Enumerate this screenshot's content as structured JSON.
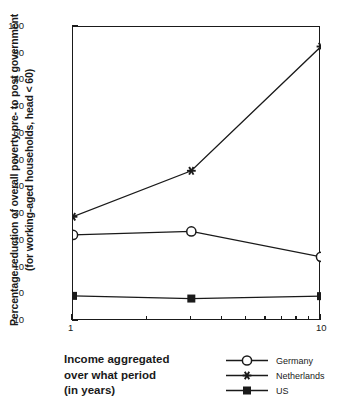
{
  "chart_data": {
    "type": "line",
    "title": "",
    "subtitle": "",
    "xlabel_lines": [
      "Income aggregated",
      "over what period",
      "(in years)"
    ],
    "ylabel_lines": [
      "Percentage reduction of overall poverty pre- to post government",
      "(for working-aged households, head < 60)"
    ],
    "x": [
      1,
      3,
      10
    ],
    "x_scale": "log",
    "xlim": [
      1,
      10
    ],
    "x_tick_labels": [
      "1",
      "10"
    ],
    "x_tick_values": [
      1,
      10
    ],
    "x_minor_ticks": [
      2,
      3,
      4,
      5,
      6,
      7,
      8,
      9
    ],
    "ylim": [
      -10,
      100
    ],
    "y_ticks": [
      -10,
      0,
      10,
      20,
      30,
      40,
      50,
      60,
      70,
      80,
      90,
      100
    ],
    "y_tick_labels": [
      "-10",
      "0",
      "10",
      "20",
      "30",
      "40",
      "50",
      "60",
      "70",
      "80",
      "90",
      "100"
    ],
    "y_minor_step": 5,
    "grid": false,
    "legend_position": "bottom-right",
    "series": [
      {
        "name": "Germany",
        "marker": "open-circle",
        "values": [
          22.2,
          23.5,
          14.0
        ],
        "color": "#1a1a1a"
      },
      {
        "name": "Netherlands",
        "marker": "asterisk",
        "values": [
          29.0,
          46.2,
          92.7
        ],
        "color": "#1a1a1a"
      },
      {
        "name": "US",
        "marker": "filled-square",
        "values": [
          -0.6,
          -1.6,
          -0.7
        ],
        "color": "#1a1a1a"
      }
    ]
  },
  "axis": {
    "y_title_line1": "Percentage reduction of overall poverty pre- to post government",
    "y_title_line2": "(for working-aged households, head < 60)",
    "x_title_line1": "Income aggregated",
    "x_title_line2": "over what period",
    "x_title_line3": "(in years)"
  },
  "legend": {
    "items": [
      {
        "label": "Germany",
        "marker": "open-circle"
      },
      {
        "label": "Netherlands",
        "marker": "asterisk"
      },
      {
        "label": "US",
        "marker": "filled-square"
      }
    ]
  },
  "colors": {
    "ink": "#1a1a1a",
    "background": "#ffffff"
  }
}
